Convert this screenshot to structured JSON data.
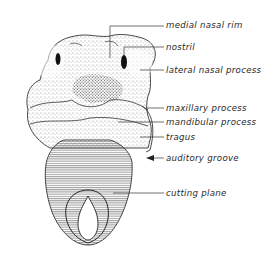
{
  "figure": {
    "colors": {
      "ink": "#2a2a2a",
      "background": "#ffffff",
      "hatch": "#555555"
    },
    "labels": [
      {
        "id": "medial-nasal-rim",
        "text": "medial nasal rim",
        "x": 166,
        "y": 20
      },
      {
        "id": "nostril",
        "text": "nostril",
        "x": 166,
        "y": 40
      },
      {
        "id": "lateral-nasal-process",
        "text": "lateral nasal process",
        "x": 166,
        "y": 64
      },
      {
        "id": "maxillary-process",
        "text": "maxillary process",
        "x": 166,
        "y": 103
      },
      {
        "id": "mandibular-process",
        "text": "mandibular process",
        "x": 166,
        "y": 116
      },
      {
        "id": "tragus",
        "text": "tragus",
        "x": 166,
        "y": 131
      },
      {
        "id": "auditory-groove",
        "text": "auditory groove",
        "x": 166,
        "y": 153
      },
      {
        "id": "cutting-plane",
        "text": "cutting plane",
        "x": 166,
        "y": 188
      }
    ]
  }
}
